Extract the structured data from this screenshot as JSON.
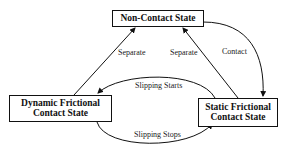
{
  "diagram": {
    "type": "state-transition",
    "states": [
      {
        "id": "non_contact",
        "label": "Non-Contact State"
      },
      {
        "id": "dynamic",
        "label_line1": "Dynamic Frictional",
        "label_line2": "Contact State"
      },
      {
        "id": "static",
        "label_line1": "Static Frictional",
        "label_line2": "Contact State"
      }
    ],
    "transitions": [
      {
        "from": "dynamic",
        "to": "non_contact",
        "label": "Separate"
      },
      {
        "from": "static",
        "to": "non_contact",
        "label": "Separate"
      },
      {
        "from": "non_contact",
        "to": "static",
        "label": "Contact"
      },
      {
        "from": "static",
        "to": "dynamic",
        "label": "Slipping Starts"
      },
      {
        "from": "dynamic",
        "to": "static",
        "label": "Slipping Stops"
      }
    ]
  }
}
